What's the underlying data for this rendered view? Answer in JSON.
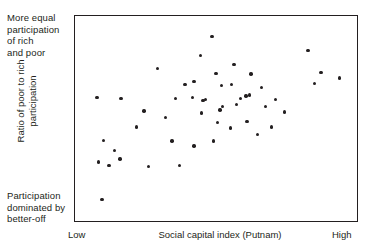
{
  "chart_data": {
    "type": "scatter",
    "title": "",
    "xlabel": "Social capital index (Putnam)",
    "ylabel": "Ratio of poor to rich participation",
    "xlim": [
      0,
      100
    ],
    "ylim": [
      0,
      100
    ],
    "grid": false,
    "legend": null,
    "x_tick_labels": [
      "Low",
      "High"
    ],
    "y_annotation_top": "More equal participation of rich and poor",
    "y_annotation_bottom": "Participation dominated by better-off",
    "marker": {
      "shape": "circle",
      "color": "#231f20",
      "size": 3.4
    },
    "n_points": 50,
    "points": [
      {
        "x": 6.0,
        "y": 7.2
      },
      {
        "x": 4.6,
        "y": 27.0
      },
      {
        "x": 8.8,
        "y": 25.0
      },
      {
        "x": 10.9,
        "y": 33.0
      },
      {
        "x": 6.7,
        "y": 38.5
      },
      {
        "x": 19.4,
        "y": 45.5
      },
      {
        "x": 13.0,
        "y": 28.5
      },
      {
        "x": 4.2,
        "y": 61.0
      },
      {
        "x": 13.4,
        "y": 60.5
      },
      {
        "x": 23.9,
        "y": 24.5
      },
      {
        "x": 22.2,
        "y": 54.0
      },
      {
        "x": 34.5,
        "y": 60.5
      },
      {
        "x": 41.5,
        "y": 69.5
      },
      {
        "x": 27.5,
        "y": 76.5
      },
      {
        "x": 44.0,
        "y": 83.5
      },
      {
        "x": 50.0,
        "y": 74.0
      },
      {
        "x": 52.5,
        "y": 56.5
      },
      {
        "x": 57.0,
        "y": 78.5
      },
      {
        "x": 38.0,
        "y": 68.0
      },
      {
        "x": 46.0,
        "y": 60.0
      },
      {
        "x": 48.5,
        "y": 93.5
      },
      {
        "x": 52.0,
        "y": 67.5
      },
      {
        "x": 56.0,
        "y": 68.0
      },
      {
        "x": 59.5,
        "y": 60.5
      },
      {
        "x": 44.5,
        "y": 53.0
      },
      {
        "x": 51.5,
        "y": 54.5
      },
      {
        "x": 45.0,
        "y": 59.5
      },
      {
        "x": 41.0,
        "y": 61.0
      },
      {
        "x": 50.5,
        "y": 48.0
      },
      {
        "x": 58.0,
        "y": 57.5
      },
      {
        "x": 63.5,
        "y": 73.5
      },
      {
        "x": 63.0,
        "y": 62.5
      },
      {
        "x": 67.5,
        "y": 66.5
      },
      {
        "x": 61.5,
        "y": 62.0
      },
      {
        "x": 55.5,
        "y": 45.0
      },
      {
        "x": 62.0,
        "y": 48.5
      },
      {
        "x": 49.0,
        "y": 38.0
      },
      {
        "x": 41.5,
        "y": 35.5
      },
      {
        "x": 33.0,
        "y": 38.0
      },
      {
        "x": 36.0,
        "y": 25.0
      },
      {
        "x": 69.0,
        "y": 56.5
      },
      {
        "x": 73.0,
        "y": 60.0
      },
      {
        "x": 76.5,
        "y": 53.5
      },
      {
        "x": 71.5,
        "y": 45.5
      },
      {
        "x": 66.0,
        "y": 41.5
      },
      {
        "x": 85.5,
        "y": 86.0
      },
      {
        "x": 90.5,
        "y": 74.5
      },
      {
        "x": 88.0,
        "y": 68.5
      },
      {
        "x": 97.5,
        "y": 71.5
      },
      {
        "x": 30.5,
        "y": 50.5
      }
    ]
  },
  "figure": {
    "annotation_top": "More equal\nparticipation\nof rich\nand poor",
    "annotation_bottom": "Participation\ndominated by\nbetter-off",
    "y_axis_label": "Ratio of poor to rich\nparticipation",
    "x_axis_label": "Social capital index (Putnam)",
    "x_tick_low": "Low",
    "x_tick_high": "High",
    "frame_color": "#231f20",
    "point_color": "#231f20",
    "background": "#ffffff"
  }
}
